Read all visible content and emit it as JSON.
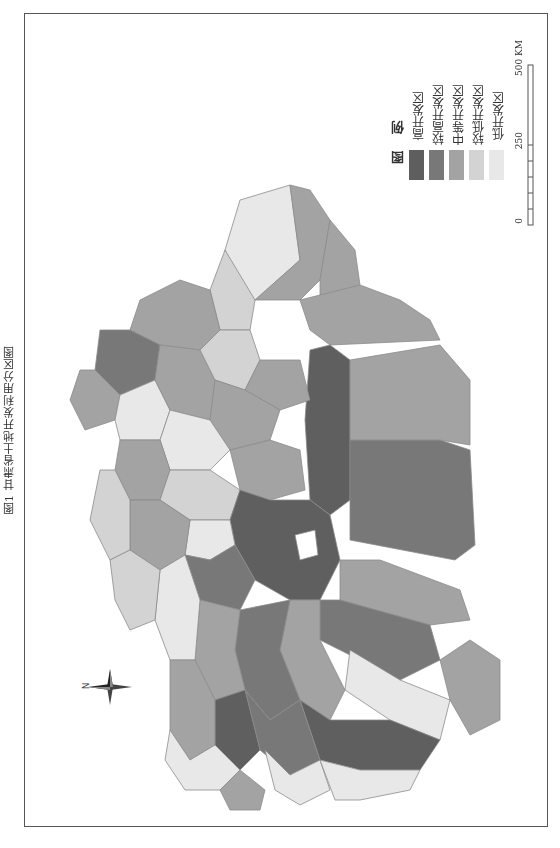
{
  "title": "图1 甘肃省土地开发利用分区图",
  "legend": {
    "heading": "图 例",
    "items": [
      {
        "label": "高开发区",
        "color": "#5e5e5e"
      },
      {
        "label": "较高开发区",
        "color": "#787878"
      },
      {
        "label": "中等开发区",
        "color": "#a3a3a3"
      },
      {
        "label": "较低开发区",
        "color": "#d3d3d3"
      },
      {
        "label": "低开发区",
        "color": "#e8e8e8"
      }
    ]
  },
  "scale_bar": {
    "ticks": [
      "0",
      "250",
      "500 KM"
    ]
  },
  "compass": {
    "label": "N"
  },
  "colors": {
    "high": "#5e5e5e",
    "mid_high": "#787878",
    "mid": "#a3a3a3",
    "low": "#d3d3d3",
    "lowest": "#e8e8e8",
    "outline": "#888888",
    "frame": "#555555"
  }
}
